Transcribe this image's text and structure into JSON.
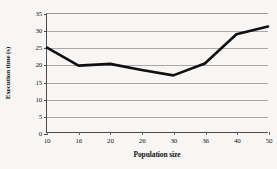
{
  "chart_data": {
    "type": "line",
    "title": "",
    "xlabel": "Population size",
    "ylabel": "Execution time (s)",
    "x": [
      10,
      16,
      20,
      26,
      30,
      36,
      40,
      50
    ],
    "values": [
      25.0,
      19.7,
      20.2,
      18.4,
      16.8,
      20.3,
      29.0,
      31.3
    ],
    "series": [
      {
        "name": "Execution time",
        "values": [
          25.0,
          19.7,
          20.2,
          18.4,
          16.8,
          20.3,
          29.0,
          31.3
        ]
      }
    ],
    "xtick_labels": [
      "10",
      "16",
      "20",
      "26",
      "30",
      "36",
      "40",
      "50"
    ],
    "xtick_values": [
      10,
      16,
      20,
      26,
      30,
      36,
      40,
      50
    ],
    "ytick_labels": [
      "0",
      "5",
      "10",
      "15",
      "20",
      "25",
      "30",
      "35"
    ],
    "ytick_values": [
      0,
      5,
      10,
      15,
      20,
      25,
      30,
      35
    ],
    "ylim": [
      0,
      35
    ],
    "xlim": [
      10,
      50
    ],
    "grid": true,
    "grid_axis": "y",
    "legend": false,
    "legend_position": "none",
    "line_color": "#101010",
    "grid_color": "#a8a8a8",
    "axis_color": "#4a4a4a",
    "background_color": "#f7f6f4",
    "line_width": 2.6,
    "markers": false
  }
}
